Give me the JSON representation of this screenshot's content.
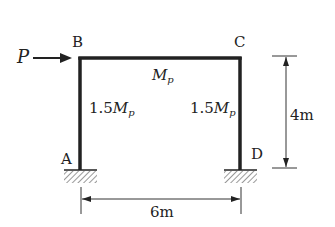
{
  "diagram": {
    "nodes": {
      "A": {
        "label": "A",
        "support": "fixed"
      },
      "B": {
        "label": "B"
      },
      "C": {
        "label": "C"
      },
      "D": {
        "label": "D",
        "support": "fixed"
      }
    },
    "load": {
      "symbol": "P",
      "direction": "right",
      "at": "B"
    },
    "members": {
      "beam": {
        "moment_coef": "",
        "moment_symbol": "M",
        "subscript": "p"
      },
      "left_column": {
        "moment_coef": "1.5",
        "moment_symbol": "M",
        "subscript": "p"
      },
      "right_column": {
        "moment_coef": "1.5",
        "moment_symbol": "M",
        "subscript": "p"
      }
    },
    "dimensions": {
      "height": "4m",
      "span": "6m"
    },
    "colors": {
      "line": "#222222",
      "hatch": "#555555"
    }
  }
}
